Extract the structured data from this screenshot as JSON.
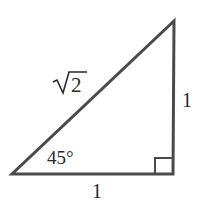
{
  "diagram": {
    "type": "right-triangle",
    "stroke_color": "#4a4a4a",
    "text_color": "#2a2a2a",
    "vertices": {
      "bottom_left": [
        12,
        174
      ],
      "bottom_right": [
        173,
        174
      ],
      "top_right": [
        174,
        21
      ]
    },
    "labels": {
      "hypotenuse": {
        "radicand": "2",
        "text": "√2"
      },
      "vertical_leg": "1",
      "horizontal_leg": "1",
      "angle": "45°"
    },
    "right_angle_marker": true
  }
}
